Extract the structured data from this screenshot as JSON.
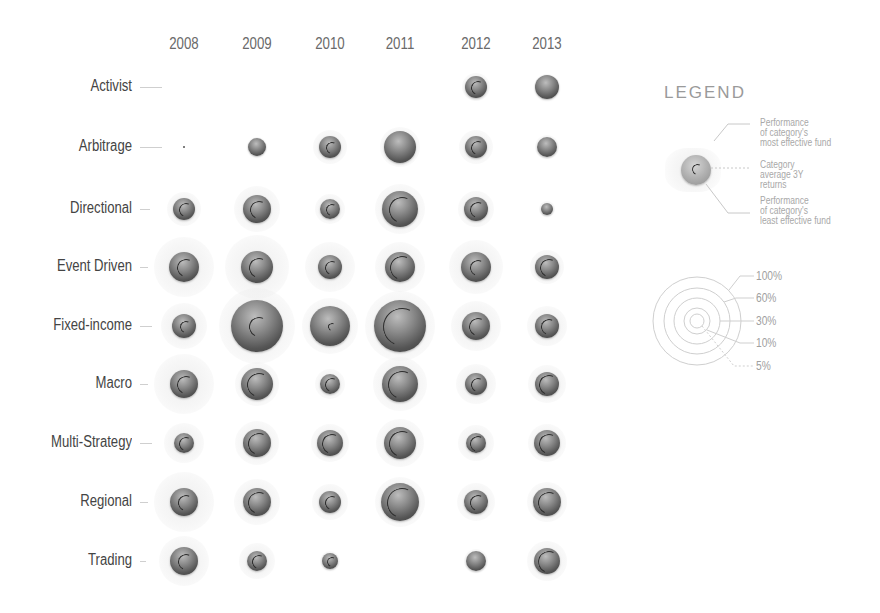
{
  "chart_data": {
    "type": "bubble-grid",
    "title": "",
    "x_label": "Year",
    "y_label": "Hedge fund category",
    "categories_x": [
      "2008",
      "2009",
      "2010",
      "2011",
      "2012",
      "2013"
    ],
    "categories_y": [
      "Activist",
      "Arbitrage",
      "Directional",
      "Event Driven",
      "Fixed-income",
      "Macro",
      "Multi-Strategy",
      "Regional",
      "Trading"
    ],
    "encoding": {
      "ball_size": "Category average 3Y returns",
      "halo_outer": "Performance of category's most effective fund",
      "inner_arc": "Performance of category's least effective fund"
    },
    "size_scale_legend": [
      "100%",
      "60%",
      "30%",
      "10%",
      "5%"
    ],
    "legend_position": "right",
    "cells": [
      {
        "category": "Activist",
        "values": [
          null,
          null,
          null,
          null,
          {
            "r": 11,
            "halo": 14,
            "arc": 6
          },
          {
            "r": 12,
            "halo": 13,
            "arc": 0
          }
        ]
      },
      {
        "category": "Arbitrage",
        "values": [
          {
            "r": 1,
            "halo": 0,
            "arc": 0
          },
          {
            "r": 9,
            "halo": 10,
            "arc": 0
          },
          {
            "r": 11,
            "halo": 17,
            "arc": 5
          },
          {
            "r": 16,
            "halo": 20,
            "arc": 0
          },
          {
            "r": 11,
            "halo": 17,
            "arc": 6
          },
          {
            "r": 10,
            "halo": 12,
            "arc": 0
          }
        ]
      },
      {
        "category": "Directional",
        "values": [
          {
            "r": 11,
            "halo": 17,
            "arc": 6
          },
          {
            "r": 14,
            "halo": 23,
            "arc": 8
          },
          {
            "r": 10,
            "halo": 15,
            "arc": 5
          },
          {
            "r": 18,
            "halo": 25,
            "arc": 12
          },
          {
            "r": 12,
            "halo": 18,
            "arc": 7
          },
          {
            "r": 6,
            "halo": 8,
            "arc": 0
          }
        ]
      },
      {
        "category": "Event Driven",
        "values": [
          {
            "r": 15,
            "halo": 30,
            "arc": 8
          },
          {
            "r": 16,
            "halo": 32,
            "arc": 9
          },
          {
            "r": 12,
            "halo": 25,
            "arc": 6
          },
          {
            "r": 15,
            "halo": 25,
            "arc": 11
          },
          {
            "r": 15,
            "halo": 27,
            "arc": 7
          },
          {
            "r": 12,
            "halo": 17,
            "arc": 8
          }
        ]
      },
      {
        "category": "Fixed-income",
        "values": [
          {
            "r": 12,
            "halo": 23,
            "arc": 5
          },
          {
            "r": 26,
            "halo": 38,
            "arc": 9
          },
          {
            "r": 20,
            "halo": 28,
            "arc": 3
          },
          {
            "r": 26,
            "halo": 35,
            "arc": 18
          },
          {
            "r": 14,
            "halo": 25,
            "arc": 8
          },
          {
            "r": 12,
            "halo": 20,
            "arc": 7
          }
        ]
      },
      {
        "category": "Macro",
        "values": [
          {
            "r": 14,
            "halo": 30,
            "arc": 8
          },
          {
            "r": 16,
            "halo": 22,
            "arc": 11
          },
          {
            "r": 10,
            "halo": 15,
            "arc": 6
          },
          {
            "r": 18,
            "halo": 27,
            "arc": 13
          },
          {
            "r": 11,
            "halo": 20,
            "arc": 6
          },
          {
            "r": 12,
            "halo": 19,
            "arc": 9
          }
        ]
      },
      {
        "category": "Multi-Strategy",
        "values": [
          {
            "r": 10,
            "halo": 20,
            "arc": 6
          },
          {
            "r": 14,
            "halo": 22,
            "arc": 10
          },
          {
            "r": 13,
            "halo": 19,
            "arc": 9
          },
          {
            "r": 16,
            "halo": 24,
            "arc": 12
          },
          {
            "r": 10,
            "halo": 18,
            "arc": 7
          },
          {
            "r": 13,
            "halo": 19,
            "arc": 9
          }
        ]
      },
      {
        "category": "Regional",
        "values": [
          {
            "r": 14,
            "halo": 30,
            "arc": 7
          },
          {
            "r": 14,
            "halo": 23,
            "arc": 10
          },
          {
            "r": 11,
            "halo": 18,
            "arc": 6
          },
          {
            "r": 19,
            "halo": 25,
            "arc": 14
          },
          {
            "r": 12,
            "halo": 19,
            "arc": 7
          },
          {
            "r": 14,
            "halo": 20,
            "arc": 10
          }
        ]
      },
      {
        "category": "Trading",
        "values": [
          {
            "r": 14,
            "halo": 25,
            "arc": 7
          },
          {
            "r": 10,
            "halo": 18,
            "arc": 6
          },
          {
            "r": 8,
            "halo": 10,
            "arc": 4
          },
          null,
          {
            "r": 10,
            "halo": 12,
            "arc": 0
          },
          {
            "r": 13,
            "halo": 20,
            "arc": 10
          }
        ]
      }
    ]
  },
  "legend": {
    "title": "LEGEND",
    "top_label": [
      "Performance",
      "of category's",
      "most effective fund"
    ],
    "middle_label": [
      "Category",
      "average 3Y",
      "returns"
    ],
    "bottom_label": [
      "Performance",
      "of category's",
      "least effective fund"
    ],
    "scale": [
      "100%",
      "60%",
      "30%",
      "10%",
      "5%"
    ]
  }
}
